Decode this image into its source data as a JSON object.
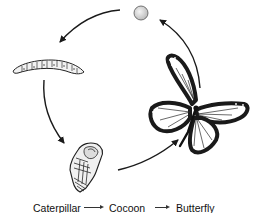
{
  "diagram": {
    "stages": [
      {
        "id": "egg",
        "label": "Egg"
      },
      {
        "id": "caterpillar",
        "label": "Caterpillar"
      },
      {
        "id": "cocoon",
        "label": "Cocoon"
      },
      {
        "id": "butterfly",
        "label": "Butterfly"
      }
    ],
    "cycle_order": [
      "butterfly",
      "egg",
      "caterpillar",
      "cocoon",
      "butterfly"
    ],
    "caption": {
      "items": [
        "Caterpillar",
        "Cocoon",
        "Butterfly"
      ],
      "arrow": "→"
    },
    "colors": {
      "line": "#1a1a1a",
      "background": "#ffffff",
      "egg_fill": "#dcdcdc"
    }
  }
}
